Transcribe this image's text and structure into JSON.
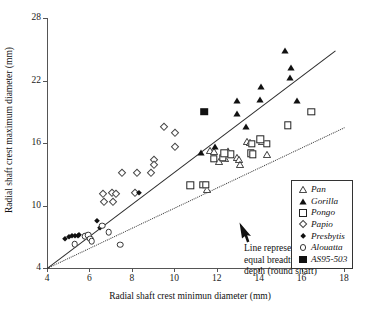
{
  "chart_data": {
    "type": "scatter",
    "title": "",
    "xlabel": "Radial shaft crest minimun diameter (mm)",
    "ylabel": "Radial shaft crest maximum diameter (mm)",
    "xlim": [
      4,
      18
    ],
    "ylim": [
      4,
      28
    ],
    "xticks": [
      4,
      6,
      8,
      10,
      12,
      14,
      16,
      18
    ],
    "yticks": [
      4,
      10,
      16,
      22,
      28
    ],
    "xtick_labels": [
      "4",
      "6",
      "8",
      "10",
      "12",
      "14",
      "16",
      "18"
    ],
    "ytick_labels": [
      "4",
      "10",
      "16",
      "22",
      "28"
    ],
    "grid": false,
    "legend_position": "bottom-right",
    "series": [
      {
        "name": "Pan",
        "marker": "open-triangle",
        "color": "#222222",
        "points": [
          [
            11.7,
            15.4
          ],
          [
            11.85,
            15.3
          ],
          [
            12.4,
            14.7
          ],
          [
            12.55,
            15.2
          ],
          [
            12.95,
            14.8
          ],
          [
            13.05,
            14.55
          ],
          [
            13.45,
            16.3
          ],
          [
            13.55,
            16.2
          ],
          [
            14.05,
            16.45
          ],
          [
            14.15,
            16.3
          ],
          [
            14.35,
            15.0
          ],
          [
            11.55,
            11.7
          ],
          [
            12.1,
            14.4
          ],
          [
            13.1,
            14.05
          ]
        ]
      },
      {
        "name": "Gorilla",
        "marker": "filled-triangle",
        "color": "#111111",
        "points": [
          [
            15.2,
            25.0
          ],
          [
            15.5,
            23.4
          ],
          [
            15.45,
            22.4
          ],
          [
            14.1,
            21.6
          ],
          [
            12.95,
            20.2
          ],
          [
            14.05,
            20.3
          ],
          [
            15.8,
            20.2
          ],
          [
            12.95,
            19.0
          ],
          [
            13.4,
            17.7
          ],
          [
            11.9,
            15.8
          ],
          [
            12.55,
            15.45
          ],
          [
            11.25,
            15.2
          ]
        ]
      },
      {
        "name": "Pongo",
        "marker": "open-square",
        "color": "#222222",
        "points": [
          [
            16.45,
            19.0
          ],
          [
            15.35,
            17.7
          ],
          [
            14.35,
            15.95
          ],
          [
            13.65,
            15.9
          ],
          [
            13.6,
            15.0
          ],
          [
            13.7,
            14.9
          ],
          [
            14.05,
            16.35
          ],
          [
            12.3,
            14.6
          ],
          [
            12.65,
            14.9
          ],
          [
            11.85,
            14.5
          ],
          [
            10.75,
            11.95
          ],
          [
            11.35,
            12.0
          ],
          [
            11.5,
            12.0
          ],
          [
            12.35,
            15.0
          ]
        ]
      },
      {
        "name": "Papio",
        "marker": "open-diamond-small",
        "color": "#444444",
        "points": [
          [
            9.5,
            17.5
          ],
          [
            10.05,
            17.0
          ],
          [
            10.05,
            15.6
          ],
          [
            9.05,
            14.4
          ],
          [
            9.05,
            13.9
          ],
          [
            8.25,
            13.1
          ],
          [
            8.9,
            13.1
          ],
          [
            7.55,
            13.1
          ],
          [
            7.05,
            11.2
          ],
          [
            6.65,
            11.1
          ],
          [
            7.25,
            11.15
          ],
          [
            8.15,
            11.2
          ],
          [
            6.7,
            10.3
          ],
          [
            7.1,
            10.3
          ]
        ]
      },
      {
        "name": "Presbytis",
        "marker": "filled-diamond",
        "color": "#111111",
        "points": [
          [
            4.85,
            6.75
          ],
          [
            5.05,
            7.0
          ],
          [
            5.2,
            7.05
          ],
          [
            5.3,
            7.05
          ],
          [
            5.45,
            7.1
          ],
          [
            5.5,
            7.15
          ],
          [
            6.35,
            8.55
          ],
          [
            6.5,
            7.85
          ],
          [
            8.35,
            11.2
          ]
        ]
      },
      {
        "name": "Alouatta",
        "marker": "open-circle-small",
        "color": "#333333",
        "points": [
          [
            5.3,
            6.3
          ],
          [
            5.8,
            7.05
          ],
          [
            5.95,
            7.15
          ],
          [
            6.05,
            6.8
          ],
          [
            6.6,
            8.05
          ],
          [
            6.9,
            7.45
          ],
          [
            7.45,
            6.25
          ],
          [
            6.1,
            6.55
          ]
        ]
      },
      {
        "name": "AS95-503",
        "marker": "filled-square",
        "color": "#111111",
        "points": [
          [
            11.4,
            19.0
          ]
        ]
      }
    ],
    "reference_lines": [
      {
        "name": "regression-line",
        "style": "solid",
        "from": [
          4.0,
          4.0
        ],
        "to": [
          17.6,
          24.9
        ]
      },
      {
        "name": "equal-breadth-depth-line",
        "style": "dotted",
        "from": [
          4.0,
          4.0
        ],
        "to": [
          18.0,
          17.5
        ]
      }
    ],
    "annotations": [
      {
        "name": "equal-breadth-note",
        "lines": [
          "Line representing",
          "equal breadth and",
          "depth (round shaft)"
        ],
        "arrow_to": [
          10.0,
          9.0
        ]
      }
    ]
  },
  "axes": {
    "x_title": "Radial shaft crest minimun diameter (mm)",
    "y_title": "Radial shaft crest maximum diameter (mm)",
    "x_ticks": [
      "4",
      "6",
      "8",
      "10",
      "12",
      "14",
      "16",
      "18"
    ],
    "y_ticks": [
      "28",
      "22",
      "16",
      "10",
      "4"
    ]
  },
  "legend": {
    "items": [
      {
        "label": "Pan",
        "marker": "open-triangle"
      },
      {
        "label": "Gorilla",
        "marker": "filled-triangle"
      },
      {
        "label": "Pongo",
        "marker": "open-square"
      },
      {
        "label": "Papio",
        "marker": "open-diamond-small"
      },
      {
        "label": "Presbytis",
        "marker": "filled-diamond"
      },
      {
        "label": "Alouatta",
        "marker": "open-circle-small"
      },
      {
        "label": "AS95-503",
        "marker": "filled-square"
      }
    ]
  },
  "annotation": {
    "line1": "Line representing",
    "line2": "equal breadth and",
    "line3": "depth (round shaft)"
  },
  "colors": {
    "axis": "#555555",
    "text": "#1a1a1a",
    "marker_dark": "#111111",
    "background": "#ffffff"
  }
}
